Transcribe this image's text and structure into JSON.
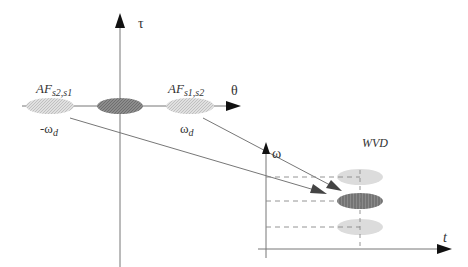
{
  "af_plot": {
    "vertical_axis_label": "τ",
    "horizontal_axis_label": "θ",
    "left_term": {
      "name": "AF",
      "subscript": "s2,s1",
      "freq_label": "-ω",
      "freq_sub": "d"
    },
    "right_term": {
      "name": "AF",
      "subscript": "s1,s2",
      "freq_label": "ω",
      "freq_sub": "d"
    }
  },
  "wvd_plot": {
    "title": "WVD",
    "vertical_axis_label": "ω",
    "horizontal_axis_label": "t"
  },
  "colors": {
    "axis": "#555555",
    "dark_ellipse": "#7a7a7a",
    "light_ellipse": "#d8d8d8",
    "arrow": "#444444"
  }
}
